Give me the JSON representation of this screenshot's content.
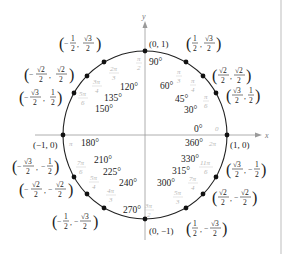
{
  "diagram": {
    "axes": {
      "x_label": "x",
      "y_label": "y"
    },
    "colors": {
      "circle": "#222222",
      "axis": "#9a9a9a",
      "radian_label": "#b8b8b8",
      "text": "#222222",
      "border": "#bdbdbd"
    },
    "points": [
      {
        "deg": "0°",
        "deg2": "360°",
        "rad": "0",
        "rad2": "2π",
        "coord": "(1, 0)"
      },
      {
        "deg": "30°",
        "rad": "π/6",
        "coord": "(√3/2, 1/2)"
      },
      {
        "deg": "45°",
        "rad": "π/4",
        "coord": "(√2/2, √2/2)"
      },
      {
        "deg": "60°",
        "rad": "π/3",
        "coord": "(1/2, √3/2)"
      },
      {
        "deg": "90°",
        "rad": "π/2",
        "coord": "(0, 1)"
      },
      {
        "deg": "120°",
        "rad": "2π/3",
        "coord": "(−1/2, √3/2)"
      },
      {
        "deg": "135°",
        "rad": "3π/4",
        "coord": "(−√2/2, √2/2)"
      },
      {
        "deg": "150°",
        "rad": "5π/6",
        "coord": "(−√3/2, 1/2)"
      },
      {
        "deg": "180°",
        "rad": "π",
        "coord": "(−1, 0)"
      },
      {
        "deg": "210°",
        "rad": "7π/6",
        "coord": "(−√3/2, −1/2)"
      },
      {
        "deg": "225°",
        "rad": "5π/4",
        "coord": "(−√2/2, −√2/2)"
      },
      {
        "deg": "240°",
        "rad": "4π/3",
        "coord": "(−1/2, −√3/2)"
      },
      {
        "deg": "270°",
        "rad": "3π/2",
        "coord": "(0, −1)"
      },
      {
        "deg": "300°",
        "rad": "5π/3",
        "coord": "(1/2, −√3/2)"
      },
      {
        "deg": "315°",
        "rad": "7π/4",
        "coord": "(√2/2, −√2/2)"
      },
      {
        "deg": "330°",
        "rad": "11π/6",
        "coord": "(√3/2, −1/2)"
      }
    ],
    "labels": {
      "p0_deg": "0°",
      "p0_deg2": "360°",
      "p0_rad": "0",
      "p0_rad2": "2π",
      "p0_coord": "(1, 0)",
      "p90_coord": "(0, 1)",
      "p180_coord": "(−1, 0)",
      "p270_coord": "(0, −1)",
      "d30": "30°",
      "d45": "45°",
      "d60": "60°",
      "d90": "90°",
      "d120": "120°",
      "d135": "135°",
      "d150": "150°",
      "d180": "180°",
      "d210": "210°",
      "d225": "225°",
      "d240": "240°",
      "d270": "270°",
      "d300": "300°",
      "d315": "315°",
      "d330": "330°",
      "pi": "π",
      "half": "1",
      "two": "2",
      "sqrt3": "√3",
      "sqrt2": "√2",
      "neg": "−",
      "comma": ",",
      "lparen": "(",
      "rparen": ")",
      "r_pi": "π"
    }
  }
}
